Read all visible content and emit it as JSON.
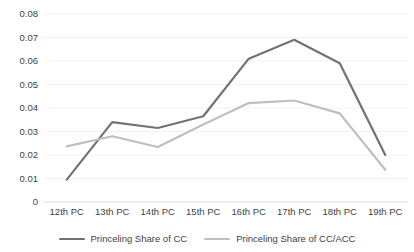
{
  "chart_data": {
    "type": "line",
    "title": "",
    "xlabel": "",
    "ylabel": "",
    "categories": [
      "12th PC",
      "13th PC",
      "14th PC",
      "15th PC",
      "16th PC",
      "17th PC",
      "18th PC",
      "19th PC"
    ],
    "ylim": [
      0,
      0.08
    ],
    "y_ticks": [
      "0.08",
      "0.07",
      "0.06",
      "0.05",
      "0.04",
      "0.03",
      "0.02",
      "0.01",
      "0"
    ],
    "y_tick_values": [
      0.08,
      0.07,
      0.06,
      0.05,
      0.04,
      0.03,
      0.02,
      0.01,
      0
    ],
    "grid": true,
    "legend_position": "bottom",
    "series": [
      {
        "name": "Princeling Share of CC",
        "color": "#767171",
        "values": [
          0.0095,
          0.034,
          0.0315,
          0.0365,
          0.061,
          0.069,
          0.059,
          0.02
        ]
      },
      {
        "name": "Princeling Share of CC/ACC",
        "color": "#bfbfbf",
        "values": [
          0.0237,
          0.028,
          0.0234,
          0.033,
          0.0421,
          0.0432,
          0.0377,
          0.0137
        ]
      }
    ]
  },
  "style": {
    "grid_color": "#f2f2f2",
    "axis_color": "#d9d9d9",
    "text_color": "#3f3f3f",
    "background": "#ffffff"
  }
}
